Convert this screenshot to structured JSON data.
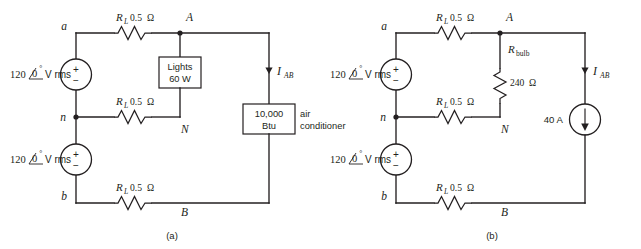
{
  "figure": {
    "background_color": "#ffffff",
    "ink_color": "#231f20"
  },
  "panels": [
    {
      "id": "a",
      "caption": "(a)",
      "nodes": {
        "a": "a",
        "n": "n",
        "b": "b",
        "A": "A",
        "N": "N",
        "B": "B"
      },
      "sources": [
        {
          "name": "top-voltage-source",
          "magnitude": "120",
          "angle_symbol": "∠",
          "angle": "0",
          "degree": "°",
          "unit": "V rms",
          "plus": "+",
          "minus": "−"
        },
        {
          "name": "bottom-voltage-source",
          "magnitude": "120",
          "angle_symbol": "∠",
          "angle": "0",
          "degree": "°",
          "unit": "V rms",
          "plus": "+",
          "minus": "−"
        }
      ],
      "resistors": [
        {
          "name": "line-resistor-top",
          "symbol": "R",
          "subscript": "L",
          "value": "0.5",
          "unit": "Ω"
        },
        {
          "name": "line-resistor-neutral",
          "symbol": "R",
          "subscript": "L",
          "value": "0.5",
          "unit": "Ω"
        },
        {
          "name": "line-resistor-bottom",
          "symbol": "R",
          "subscript": "L",
          "value": "0.5",
          "unit": "Ω"
        }
      ],
      "loads": [
        {
          "name": "lights-load",
          "line1": "Lights",
          "line2": "60 W"
        },
        {
          "name": "air-conditioner-load",
          "line1": "10,000",
          "line2": "Btu",
          "side_line1": "air",
          "side_line2": "conditioner"
        }
      ],
      "currents": [
        {
          "name": "current-i-ab",
          "symbol": "I",
          "subscript": "AB"
        }
      ]
    },
    {
      "id": "b",
      "caption": "(b)",
      "nodes": {
        "a": "a",
        "n": "n",
        "b": "b",
        "A": "A",
        "N": "N",
        "B": "B"
      },
      "sources": [
        {
          "name": "top-voltage-source",
          "magnitude": "120",
          "angle_symbol": "∠",
          "angle": "0",
          "degree": "°",
          "unit": "V rms",
          "plus": "+",
          "minus": "−"
        },
        {
          "name": "bottom-voltage-source",
          "magnitude": "120",
          "angle_symbol": "∠",
          "angle": "0",
          "degree": "°",
          "unit": "V rms",
          "plus": "+",
          "minus": "−"
        }
      ],
      "resistors": [
        {
          "name": "line-resistor-top",
          "symbol": "R",
          "subscript": "L",
          "value": "0.5",
          "unit": "Ω"
        },
        {
          "name": "line-resistor-neutral",
          "symbol": "R",
          "subscript": "L",
          "value": "0.5",
          "unit": "Ω"
        },
        {
          "name": "line-resistor-bottom",
          "symbol": "R",
          "subscript": "L",
          "value": "0.5",
          "unit": "Ω"
        },
        {
          "name": "bulb-resistor",
          "symbol": "R",
          "subscript": "bulb",
          "value": "240",
          "unit": "Ω"
        }
      ],
      "current_sources": [
        {
          "name": "current-source-40a",
          "value": "40 A"
        }
      ],
      "currents": [
        {
          "name": "current-i-ab",
          "symbol": "I",
          "subscript": "AB"
        }
      ]
    }
  ]
}
